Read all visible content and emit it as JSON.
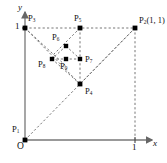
{
  "figure": {
    "axes": {
      "x_label": "x",
      "y_label": "y",
      "origin_label": "O",
      "x_tick_label": "1",
      "y_tick_label": "1",
      "x_range": [
        0,
        1.18
      ],
      "y_range": [
        0,
        1.18
      ]
    },
    "style": {
      "line_color": "#555555",
      "axis_color": "#666666",
      "point_color": "#000000",
      "background": "#ffffff",
      "line_style": "dashed"
    },
    "points": [
      {
        "id": "P1",
        "label": "P",
        "sub": "1",
        "x": 0.0,
        "y": 0.0,
        "label_dx": -13,
        "label_dy": -13
      },
      {
        "id": "P2",
        "label": "P",
        "sub": "2",
        "x": 1.0,
        "y": 1.0,
        "label_dx": 4,
        "label_dy": -11,
        "extra": "(1, 1)"
      },
      {
        "id": "P3",
        "label": "P",
        "sub": "3",
        "x": 0.0,
        "y": 1.0,
        "label_dx": 3,
        "label_dy": -12
      },
      {
        "id": "P4",
        "label": "P",
        "sub": "4",
        "x": 0.5,
        "y": 0.5,
        "label_dx": 4,
        "label_dy": 3
      },
      {
        "id": "P5",
        "label": "P",
        "sub": "5",
        "x": 0.5,
        "y": 1.0,
        "label_dx": -3,
        "label_dy": -12
      },
      {
        "id": "P6",
        "label": "P",
        "sub": "6",
        "x": 0.375,
        "y": 0.8,
        "label_dx": -12,
        "label_dy": -11
      },
      {
        "id": "P7",
        "label": "P",
        "sub": "7",
        "x": 0.5,
        "y": 0.665,
        "label_dx": 4,
        "label_dy": -1
      },
      {
        "id": "P8",
        "label": "P",
        "sub": "8",
        "x": 0.25,
        "y": 0.665,
        "label_dx": -13,
        "label_dy": 4
      },
      {
        "id": "P9",
        "label": "P",
        "sub": "9",
        "x": 0.375,
        "y": 0.665,
        "label_dx": -3,
        "label_dy": 5
      }
    ],
    "segments": [
      {
        "from": "P1",
        "to": "P2",
        "note": "diagonal origin to (1,1)"
      },
      {
        "from": "P3",
        "to": "P2",
        "note": "top edge"
      },
      {
        "from": "P3",
        "to": "P4",
        "note": "from (0,1) down-right"
      },
      {
        "from": "P2",
        "to": "P4",
        "note": "from (1,1) down-left"
      },
      {
        "from": "P5",
        "to": "P4",
        "note": "vertical through cluster"
      },
      {
        "from": "P3",
        "to": "P9",
        "note": "through midpoint cluster"
      },
      {
        "from": "P5",
        "to": "P8",
        "note": "cross diagonal"
      },
      {
        "from": "P6",
        "to": "P7",
        "note": "cluster diagonal"
      },
      {
        "from": "P8",
        "to": "P7",
        "note": "cluster horizontal"
      },
      {
        "from": "P6",
        "to": "P8",
        "note": "cluster left edge"
      },
      {
        "from": "P2",
        "to": "Pxfoot",
        "note": "vertical drop to x=1"
      }
    ]
  }
}
